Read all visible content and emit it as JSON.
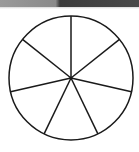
{
  "diagram": {
    "type": "circle-divided-into-equal-sectors",
    "sectors": 7,
    "center": [
      71,
      78
    ],
    "radius": 62,
    "start_angle_deg": -90,
    "stroke_color": "#1a1a1a",
    "fill_color": "#ffffff",
    "shaded_sectors": []
  },
  "top_strip": {
    "colors": [
      "#9a9a9a",
      "#3c3c3c"
    ]
  }
}
